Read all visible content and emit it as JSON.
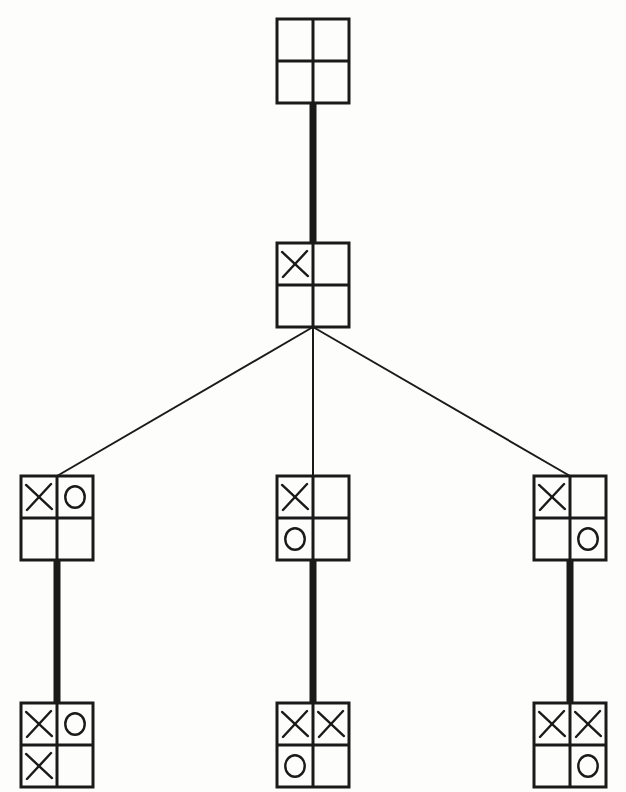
{
  "figure": {
    "kind": "game-tree",
    "background_color": "#fdfdfc",
    "ink_color": "#1a1a1a",
    "canvas": {
      "width": 626,
      "height": 792
    }
  },
  "board": {
    "rows": 2,
    "cols": 2,
    "cell_symbols": {
      "empty": "",
      "x": "X",
      "o": "O"
    }
  },
  "style": {
    "node_width": 72,
    "node_height": 84,
    "board_stroke": 3.0,
    "glyph_stroke": 2.4,
    "thick_edge_width": 7,
    "thin_edge_width": 2
  },
  "nodes": [
    {
      "id": "n0",
      "level": 0,
      "label": "root-empty-board",
      "center_x": 313,
      "center_y": 61,
      "cells": [
        "",
        "",
        "",
        ""
      ],
      "cells_readable": "empty board"
    },
    {
      "id": "n1",
      "level": 1,
      "label": "x-top-left",
      "center_x": 313,
      "center_y": 285,
      "cells": [
        "X",
        "",
        "",
        ""
      ],
      "cells_readable": "X top-left"
    },
    {
      "id": "n2",
      "level": 2,
      "label": "x-top-left-o-top-right",
      "center_x": 57,
      "center_y": 518,
      "cells": [
        "X",
        "O",
        "",
        ""
      ],
      "cells_readable": "X top-left, O top-right"
    },
    {
      "id": "n3",
      "level": 2,
      "label": "x-top-left-o-bottom-left",
      "center_x": 313,
      "center_y": 518,
      "cells": [
        "X",
        "",
        "O",
        ""
      ],
      "cells_readable": "X top-left, O bottom-left"
    },
    {
      "id": "n4",
      "level": 2,
      "label": "x-top-left-o-bottom-right",
      "center_x": 570,
      "center_y": 518,
      "cells": [
        "X",
        "",
        "",
        "O"
      ],
      "cells_readable": "X top-left, O bottom-right"
    },
    {
      "id": "n5",
      "level": 3,
      "label": "x-top-left-o-top-right-x-bottom-left",
      "center_x": 57,
      "center_y": 745,
      "cells": [
        "X",
        "O",
        "X",
        ""
      ],
      "cells_readable": "X top-left, O top-right, X bottom-left"
    },
    {
      "id": "n6",
      "level": 3,
      "label": "x-top-left-x-top-right-o-bottom-left",
      "center_x": 313,
      "center_y": 745,
      "cells": [
        "X",
        "X",
        "O",
        ""
      ],
      "cells_readable": "X top-left, X top-right, O bottom-left"
    },
    {
      "id": "n7",
      "level": 3,
      "label": "x-top-left-x-top-right-o-bottom-right",
      "center_x": 570,
      "center_y": 745,
      "cells": [
        "X",
        "X",
        "",
        "O"
      ],
      "cells_readable": "X top-left, X top-right, O bottom-right"
    }
  ],
  "edges": [
    {
      "id": "e0",
      "from": "n0",
      "to": "n1",
      "weight": "thick",
      "label": "root-to-x-move"
    },
    {
      "id": "e1",
      "from": "n1",
      "to": "n2",
      "weight": "thin",
      "label": "branch-left"
    },
    {
      "id": "e2",
      "from": "n1",
      "to": "n3",
      "weight": "thin",
      "label": "branch-middle"
    },
    {
      "id": "e3",
      "from": "n1",
      "to": "n4",
      "weight": "thin",
      "label": "branch-right"
    },
    {
      "id": "e4",
      "from": "n2",
      "to": "n5",
      "weight": "thick",
      "label": "edge-left-leaf"
    },
    {
      "id": "e5",
      "from": "n3",
      "to": "n6",
      "weight": "thick",
      "label": "edge-middle-leaf"
    },
    {
      "id": "e6",
      "from": "n4",
      "to": "n7",
      "weight": "thick",
      "label": "edge-right-leaf"
    }
  ]
}
